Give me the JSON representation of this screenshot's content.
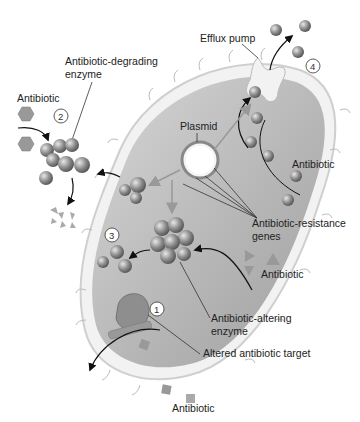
{
  "diagram": {
    "labels": {
      "efflux_pump": "Efflux pump",
      "antibiotic_degrading_enzyme_1": "Antibiotic-degrading",
      "antibiotic_degrading_enzyme_2": "enzyme",
      "plasmid": "Plasmid",
      "antibiotic_top_left": "Antibiotic",
      "antibiotic_right": "Antibiotic",
      "antibiotic_mid_right": "Antibiotic",
      "antibiotic_bottom": "Antibiotic",
      "resistance_genes_1": "Antibiotic-resistance",
      "resistance_genes_2": "genes",
      "altering_enzyme_1": "Antibiotic-altering",
      "altering_enzyme_2": "enzyme",
      "altered_target": "Altered antibiotic target"
    },
    "step_numbers": {
      "one": "1",
      "two": "2",
      "three": "3",
      "four": "4"
    },
    "colors": {
      "cell_fill": "#b9b9b9",
      "cell_wall": "#eeeeee",
      "molecule": "#8a8a8a",
      "arrow": "#111111"
    }
  }
}
